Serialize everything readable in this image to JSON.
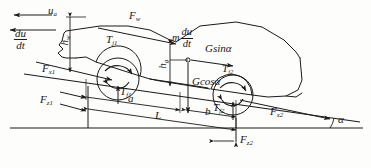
{
  "figure": {
    "type": "free-body-diagram",
    "ink_color": "#1a1a1a",
    "background_color": "#fdfdfc"
  },
  "labels": {
    "velocity": "u",
    "velocity_sub": "a",
    "accel_num": "du",
    "accel_den": "dt",
    "aero_drag": "F",
    "aero_drag_sub": "w",
    "inertia_pre": "m",
    "inertia_num": "du",
    "inertia_den": "dt",
    "grade_force": "Gsin",
    "grade_force_angle": "α",
    "normal_weight": "Gcos",
    "normal_weight_angle": "α",
    "cg_height": "h",
    "cg_height_sub": "g",
    "drag_height": "h",
    "drag_height_sub": "w",
    "front_inertia_torque": "T",
    "front_inertia_torque_sub": "j1",
    "rear_inertia_torque": "T",
    "rear_inertia_torque_sub": "j2",
    "front_roll_torque": "T",
    "front_roll_torque_sub": "f1",
    "rear_roll_torque": "T",
    "rear_roll_torque_sub": "f2",
    "front_long_force": "F",
    "front_long_force_sub": "x1",
    "rear_long_force": "F",
    "rear_long_force_sub": "x2",
    "front_normal_force": "F",
    "front_normal_force_sub": "z1",
    "rear_normal_force": "F",
    "rear_normal_force_sub": "z2",
    "dim_a": "a",
    "dim_b": "b",
    "dim_L": "L",
    "slope_angle": "α"
  },
  "geometry": {
    "incline_angle_deg": 8,
    "front_axle": {
      "x": 118,
      "y": 79
    },
    "rear_axle": {
      "x": 233,
      "y": 95
    },
    "center_of_gravity": {
      "x": 188,
      "y": 60
    },
    "ground_line_y": 128
  }
}
